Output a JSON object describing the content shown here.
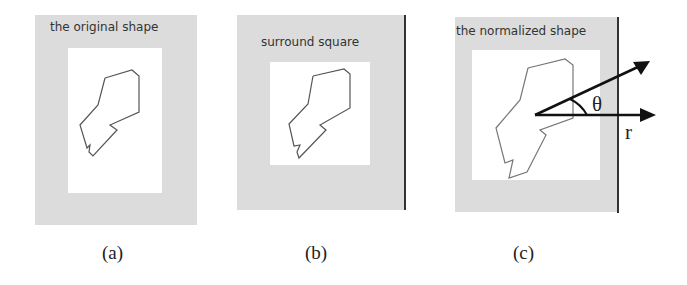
{
  "panels": [
    {
      "id": "a",
      "title": "the original shape",
      "caption": "(a)"
    },
    {
      "id": "b",
      "title": "surround square",
      "caption": "(b)"
    },
    {
      "id": "c",
      "title": "the normalized shape",
      "caption": "(c)"
    }
  ],
  "annotations": {
    "angle_symbol": "θ",
    "radius_symbol": "r"
  },
  "colors": {
    "panel_background": "#dcdcdc",
    "shape_outline": "#555555",
    "arrow": "#111111"
  }
}
